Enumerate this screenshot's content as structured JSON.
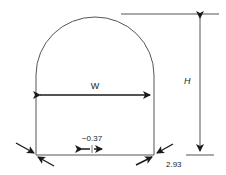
{
  "diagram": {
    "type": "tunnel-cross-section",
    "shape": "horseshoe / arched tunnel profile",
    "labels": {
      "width": "W",
      "height": "H",
      "floor_convergence": "−0.37",
      "corner_value": "2.93"
    },
    "colors": {
      "line": "#555555",
      "arrow": "#1a1a1a",
      "background": "#ffffff"
    }
  }
}
